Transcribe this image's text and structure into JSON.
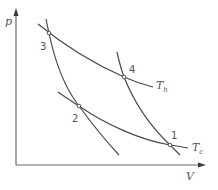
{
  "diagram": {
    "type": "pv-diagram",
    "axes": {
      "y_label": "p",
      "x_label": "V"
    },
    "isotherms": [
      {
        "label_main": "T",
        "label_sub": "h",
        "name": "hot isotherm"
      },
      {
        "label_main": "T",
        "label_sub": "c",
        "name": "cold isotherm"
      }
    ],
    "points": [
      {
        "id": "1",
        "label": "1"
      },
      {
        "id": "2",
        "label": "2"
      },
      {
        "id": "3",
        "label": "3"
      },
      {
        "id": "4",
        "label": "4"
      }
    ],
    "colors": {
      "line": "#4a4a4a",
      "axis": "#6a6a6a",
      "text": "#555555",
      "background": "#ffffff"
    }
  }
}
